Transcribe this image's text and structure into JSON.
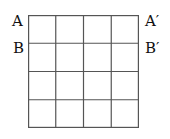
{
  "diagram": {
    "rows": 4,
    "cols": 4,
    "line_color": "#555555",
    "labels": {
      "top_left": "A",
      "top_right": "A′",
      "second_left": "B",
      "second_right": "B′"
    }
  }
}
